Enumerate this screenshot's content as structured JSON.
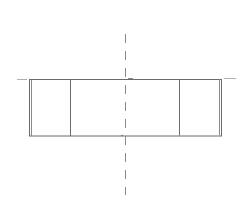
{
  "drawing": {
    "type": "technical-section-view",
    "colors": {
      "background": "#ffffff",
      "outline": "#6b6b6b",
      "centerline": "#8a8a8a",
      "extension": "#b0b0b0"
    },
    "outline_rect": {
      "x1": 29,
      "y1": 79,
      "x2": 222,
      "y2": 136
    },
    "inner_lines_x": [
      70,
      179
    ],
    "outer_double_lines_x": [
      31,
      220
    ],
    "centerline": {
      "x": 125,
      "y_top": 34,
      "y_bottom": 195,
      "dash": "8 7"
    },
    "extension_lines": [
      {
        "x1": 17,
        "y1": 79,
        "x2": 27,
        "y2": 79
      },
      {
        "x1": 224,
        "y1": 78,
        "x2": 236,
        "y2": 78
      }
    ]
  }
}
